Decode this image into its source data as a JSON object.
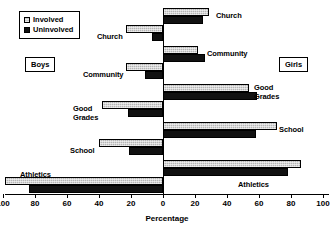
{
  "chart_data": {
    "type": "bar",
    "orientation": "horizontal-diverging",
    "title": "",
    "xlabel": "Percentage",
    "ylabel": "",
    "xlim": [
      -100,
      100
    ],
    "xticks": [
      100,
      80,
      60,
      40,
      20,
      0,
      20,
      40,
      60,
      80,
      100
    ],
    "grid": false,
    "legend_position": "top-left",
    "categories": [
      "Church",
      "Community",
      "Good Grades",
      "School",
      "Athletics"
    ],
    "groups": [
      {
        "name": "Boys",
        "side": "left",
        "series": [
          {
            "name": "Involved",
            "values": [
              23,
              23,
              38,
              40,
              99
            ]
          },
          {
            "name": "Uninvolved",
            "values": [
              7,
              11,
              22,
              21,
              84
            ]
          }
        ]
      },
      {
        "name": "Girls",
        "side": "right",
        "series": [
          {
            "name": "Involved",
            "values": [
              29,
              22,
              54,
              71,
              86
            ]
          },
          {
            "name": "Uninvolved",
            "values": [
              25,
              26,
              59,
              58,
              78
            ]
          }
        ]
      }
    ],
    "annotations": [
      "Boys",
      "Girls"
    ]
  },
  "legend": {
    "items": [
      {
        "label": "Involved",
        "swatch": "light-gray-hatched"
      },
      {
        "label": "Uninvolved",
        "swatch": "black"
      }
    ]
  },
  "side_labels": {
    "boys": "Boys",
    "girls": "Girls"
  },
  "axis": {
    "title": "Percentage",
    "tick_labels": [
      "100",
      "80",
      "60",
      "40",
      "20",
      "0",
      "20",
      "40",
      "60",
      "80",
      "100"
    ]
  },
  "bar_labels": {
    "girls": [
      "Church",
      "Community",
      "Good",
      "Grades",
      "School",
      "Athletics"
    ],
    "boys": [
      "Church",
      "Community",
      "Good",
      "Grades",
      "School",
      "Athletics"
    ]
  },
  "colors": {
    "involved": "#b5b5b5",
    "uninvolved": "#111111",
    "axis": "#000000",
    "background": "#ffffff"
  }
}
